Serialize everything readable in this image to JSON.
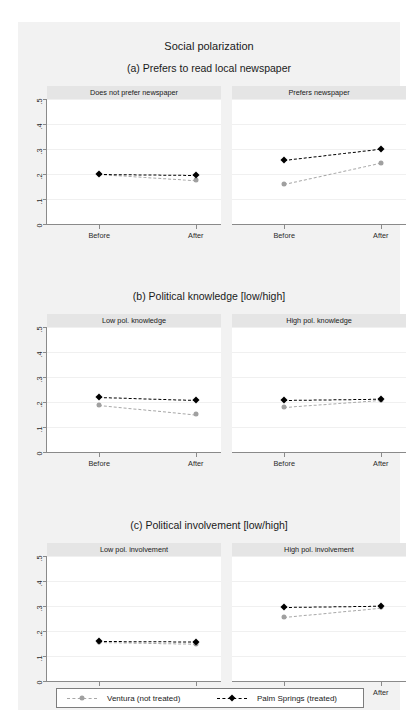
{
  "figure": {
    "title": "Social polarization",
    "y_axis_title": "Social polarization [0-1]",
    "colors": {
      "treated": "#000000",
      "not_treated": "#a0a0a0",
      "panel_header": "#e5e5e5",
      "figure_background": "#f2f2f2",
      "axis": "#8a8a8a"
    }
  },
  "legend": {
    "entries": [
      {
        "label": "Ventura (not treated)",
        "marker": "circle",
        "color": "#a0a0a0"
      },
      {
        "label": "Palm Springs (treated)",
        "marker": "diamond",
        "color": "#000000"
      }
    ]
  },
  "chart_data": {
    "type": "line",
    "title": "Social polarization",
    "xlabel": "",
    "ylabel": "Social polarization [0-1]",
    "x": [
      "Before",
      "After"
    ],
    "ylim": [
      0,
      0.5
    ],
    "yticks": [
      0,
      0.1,
      0.2,
      0.3,
      0.4,
      0.5
    ],
    "ytick_labels": [
      "0",
      ".1",
      ".2",
      ".3",
      ".4",
      ".5"
    ],
    "grid": true,
    "legend_position": "bottom",
    "series_names": [
      "Ventura (not treated)",
      "Palm Springs (treated)"
    ],
    "sections": [
      {
        "id": "a",
        "title": "(a) Prefers to read local newspaper",
        "panels": [
          {
            "title": "Does not prefer newspaper",
            "series": [
              {
                "name": "Ventura (not treated)",
                "values": [
                  0.2,
                  0.175
                ]
              },
              {
                "name": "Palm Springs (treated)",
                "values": [
                  0.201,
                  0.197
                ]
              }
            ]
          },
          {
            "title": "Prefers newspaper",
            "series": [
              {
                "name": "Ventura (not treated)",
                "values": [
                  0.16,
                  0.245
                ]
              },
              {
                "name": "Palm Springs (treated)",
                "values": [
                  0.255,
                  0.3
                ]
              }
            ]
          }
        ]
      },
      {
        "id": "b",
        "title": "(b) Political knowledge [low/high]",
        "panels": [
          {
            "title": "Low pol. knowledge",
            "series": [
              {
                "name": "Ventura (not treated)",
                "values": [
                  0.19,
                  0.152
                ]
              },
              {
                "name": "Palm Springs (treated)",
                "values": [
                  0.22,
                  0.208
                ]
              }
            ]
          },
          {
            "title": "High pol. knowledge",
            "series": [
              {
                "name": "Ventura (not treated)",
                "values": [
                  0.18,
                  0.208
                ]
              },
              {
                "name": "Palm Springs (treated)",
                "values": [
                  0.208,
                  0.213
                ]
              }
            ]
          }
        ]
      },
      {
        "id": "c",
        "title": "(c) Political involvement [low/high]",
        "panels": [
          {
            "title": "Low pol. involvement",
            "series": [
              {
                "name": "Ventura (not treated)",
                "values": [
                  0.155,
                  0.148
                ]
              },
              {
                "name": "Palm Springs (treated)",
                "values": [
                  0.159,
                  0.157
                ]
              }
            ]
          },
          {
            "title": "High pol. involvement",
            "series": [
              {
                "name": "Ventura (not treated)",
                "values": [
                  0.258,
                  0.295
                ]
              },
              {
                "name": "Palm Springs (treated)",
                "values": [
                  0.295,
                  0.3
                ]
              }
            ]
          }
        ]
      }
    ]
  }
}
